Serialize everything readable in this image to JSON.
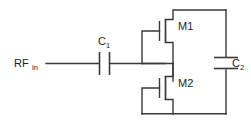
{
  "diagram": {
    "type": "circuit-schematic",
    "line_color": "#3a3a3a",
    "text_color": "#1d1d1d",
    "background": "#ffffff"
  },
  "labels": {
    "rf_in_base": "RF",
    "rf_in_sub": "in",
    "c1_base": "C",
    "c1_sub": "1",
    "c2_base": "C",
    "c2_sub": "2",
    "m1": "M1",
    "m2": "M2"
  },
  "components": [
    {
      "id": "RF_in",
      "kind": "port",
      "label": "RFin"
    },
    {
      "id": "C1",
      "kind": "capacitor",
      "label": "C1",
      "orientation": "series-horizontal"
    },
    {
      "id": "M1",
      "kind": "mosfet",
      "label": "M1",
      "configuration": "diode-connected",
      "position": "upper"
    },
    {
      "id": "M2",
      "kind": "mosfet",
      "label": "M2",
      "configuration": "diode-connected",
      "position": "lower"
    },
    {
      "id": "C2",
      "kind": "capacitor",
      "label": "C2",
      "orientation": "shunt-vertical"
    }
  ],
  "nets": [
    {
      "from": "RF_in",
      "to": "C1"
    },
    {
      "from": "C1",
      "to": "M1/M2 common node"
    },
    {
      "from": "M1 drain",
      "to": "C2 top / right rail"
    },
    {
      "from": "M2 source",
      "to": "C2 bottom / right rail"
    }
  ]
}
